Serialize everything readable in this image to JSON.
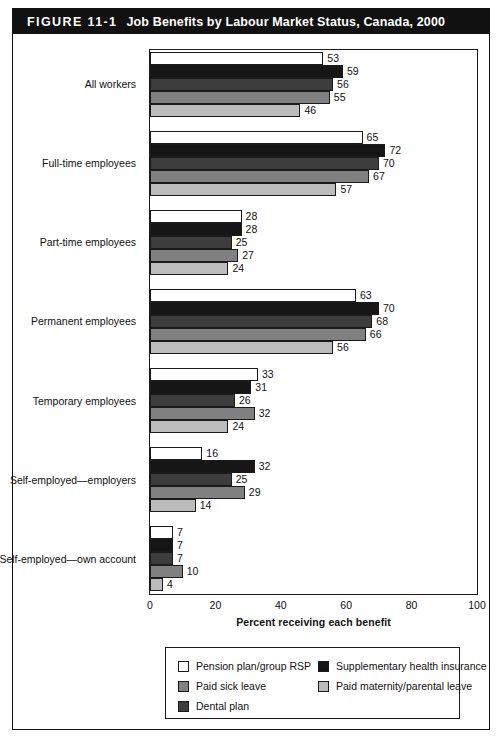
{
  "figure": {
    "number": "FIGURE 11-1",
    "title": "Job Benefits by Labour Market Status, Canada, 2000"
  },
  "chart_data": {
    "type": "bar",
    "orientation": "horizontal",
    "title": "Job Benefits by Labour Market Status, Canada, 2000",
    "xlabel": "Percent receiving each benefit",
    "ylabel": "",
    "xlim": [
      0,
      100
    ],
    "xticks": [
      0,
      20,
      40,
      60,
      80,
      100
    ],
    "grid": false,
    "legend_position": "bottom",
    "categories": [
      "All workers",
      "Full-time employees",
      "Part-time employees",
      "Permanent employees",
      "Temporary employees",
      "Self-employed—employers",
      "Self-employed—own account"
    ],
    "series": [
      {
        "name": "Pension plan/group RSP",
        "color": "#ffffff",
        "swatch": "sw-white",
        "values": [
          53,
          65,
          28,
          63,
          33,
          16,
          7
        ]
      },
      {
        "name": "Supplementary health insurance",
        "color": "#161616",
        "swatch": "sw-black",
        "values": [
          59,
          72,
          28,
          70,
          31,
          32,
          7
        ]
      },
      {
        "name": "Dental plan",
        "color": "#3d3d3d",
        "swatch": "sw-dark",
        "values": [
          56,
          70,
          25,
          68,
          26,
          25,
          7
        ]
      },
      {
        "name": "Paid sick leave",
        "color": "#808080",
        "swatch": "sw-medium",
        "values": [
          55,
          67,
          27,
          66,
          32,
          29,
          10
        ]
      },
      {
        "name": "Paid maternity/parental leave",
        "color": "#bcbcbc",
        "swatch": "sw-light",
        "values": [
          46,
          57,
          24,
          56,
          24,
          14,
          4
        ]
      }
    ]
  },
  "axis": {
    "x_title": "Percent receiving each benefit",
    "x_ticks": [
      "0",
      "20",
      "40",
      "60",
      "80",
      "100"
    ]
  },
  "legend": {
    "left_column": [
      {
        "label": "Pension plan/group RSP",
        "swatch": "sw-white"
      },
      {
        "label": "Paid sick leave",
        "swatch": "sw-medium"
      },
      {
        "label": "Dental plan",
        "swatch": "sw-dark"
      }
    ],
    "right_column": [
      {
        "label": "Supplementary health insurance",
        "swatch": "sw-black"
      },
      {
        "label": "Paid maternity/parental leave",
        "swatch": "sw-light"
      }
    ]
  }
}
